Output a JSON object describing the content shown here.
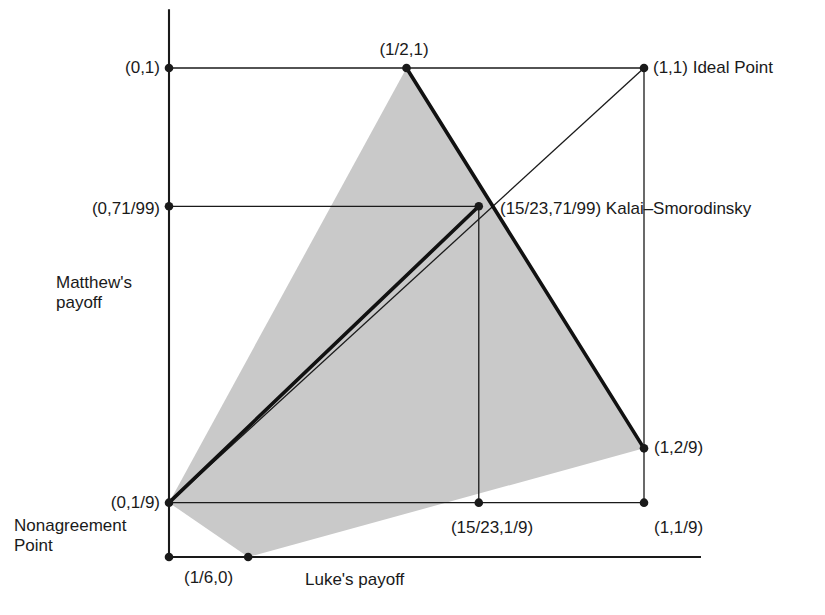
{
  "figure": {
    "axis_labels": {
      "x": "Luke's payoff",
      "y": "Matthew's\npayoff"
    },
    "colors": {
      "region_fill": "#c9c9c9",
      "stroke": "#1a1a1a",
      "thick_stroke": "#111111",
      "background": "#ffffff"
    }
  },
  "annotations": [
    {
      "id": "pt-0-1",
      "text": "(0,1)",
      "x": 0.0,
      "y": 1.0
    },
    {
      "id": "pt-half-1",
      "text": "(1/2,1)",
      "x": 0.5,
      "y": 1.0
    },
    {
      "id": "pt-ideal",
      "text": "(1,1) Ideal Point",
      "x": 1.0,
      "y": 1.0
    },
    {
      "id": "pt-0-71-99",
      "text": "(0,71/99)",
      "x": 0.0,
      "y": 0.717171
    },
    {
      "id": "pt-ks",
      "text": "(15/23,71/99) Kalai–Smorodinsky",
      "x": 0.652174,
      "y": 0.717171
    },
    {
      "id": "pt-1-2-9",
      "text": "(1,2/9)",
      "x": 1.0,
      "y": 0.222222
    },
    {
      "id": "pt-0-1-9",
      "text": "(0,1/9)",
      "x": 0.0,
      "y": 0.111111
    },
    {
      "id": "pt-1523-1-9",
      "text": "(15/23,1/9)",
      "x": 0.652174,
      "y": 0.111111
    },
    {
      "id": "pt-1-1-9",
      "text": "(1,1/9)",
      "x": 1.0,
      "y": 0.111111
    },
    {
      "id": "pt-sixth-0",
      "text": "(1/6,0)",
      "x": 0.166667,
      "y": 0.0
    },
    {
      "id": "nonagreement",
      "text": "Nonagreement\nPoint",
      "x": 0.0,
      "y": 0.111111
    }
  ],
  "chart_data": {
    "type": "scatter",
    "title": "",
    "xlabel": "Luke's payoff",
    "ylabel": "Matthew's payoff",
    "xlim": [
      0,
      1
    ],
    "ylim": [
      0,
      1
    ],
    "grid": false,
    "legend": "none",
    "points": [
      {
        "label": "(0,1)",
        "x": 0.0,
        "y": 1.0,
        "marker": true
      },
      {
        "label": "(1/2,1)",
        "x": 0.5,
        "y": 1.0,
        "marker": true
      },
      {
        "label": "(1,1)",
        "x": 1.0,
        "y": 1.0,
        "marker": true,
        "name": "Ideal Point"
      },
      {
        "label": "(0,71/99)",
        "x": 0.0,
        "y": 0.71717,
        "marker": true
      },
      {
        "label": "(15/23,71/99)",
        "x": 0.65217,
        "y": 0.71717,
        "marker": true,
        "name": "Kalai-Smorodinsky"
      },
      {
        "label": "(1,2/9)",
        "x": 1.0,
        "y": 0.22222,
        "marker": true
      },
      {
        "label": "(0,1/9)",
        "x": 0.0,
        "y": 0.11111,
        "marker": true,
        "name": "Nonagreement Point"
      },
      {
        "label": "(15/23,1/9)",
        "x": 0.65217,
        "y": 0.11111,
        "marker": true
      },
      {
        "label": "(1,1/9)",
        "x": 1.0,
        "y": 0.11111,
        "marker": true
      },
      {
        "label": "(1/6,0)",
        "x": 0.16667,
        "y": 0.0,
        "marker": true
      },
      {
        "label": "(0,0)",
        "x": 0.0,
        "y": 0.0,
        "marker": true
      }
    ],
    "feasible_region": {
      "name": "bargaining set",
      "fill": "#c9c9c9",
      "vertices": [
        {
          "x": 0.0,
          "y": 0.11111
        },
        {
          "x": 0.5,
          "y": 1.0
        },
        {
          "x": 1.0,
          "y": 0.22222
        },
        {
          "x": 0.16667,
          "y": 0.0
        }
      ]
    },
    "lines": [
      {
        "name": "ideal-ray",
        "from": {
          "x": 0.0,
          "y": 0.11111
        },
        "to": {
          "x": 1.0,
          "y": 1.0
        },
        "weight": "thin"
      },
      {
        "name": "nash-ray-thick",
        "from": {
          "x": 0.0,
          "y": 0.11111
        },
        "to": {
          "x": 0.65217,
          "y": 0.71717
        },
        "weight": "thick"
      },
      {
        "name": "pareto-upper",
        "from": {
          "x": 0.5,
          "y": 1.0
        },
        "to": {
          "x": 1.0,
          "y": 0.22222
        },
        "weight": "thick"
      },
      {
        "name": "guide-y-1",
        "from": {
          "x": 0.0,
          "y": 1.0
        },
        "to": {
          "x": 1.0,
          "y": 1.0
        },
        "weight": "thin"
      },
      {
        "name": "guide-y-71-99",
        "from": {
          "x": 0.0,
          "y": 0.71717
        },
        "to": {
          "x": 0.65217,
          "y": 0.71717
        },
        "weight": "thin"
      },
      {
        "name": "guide-y-1-9",
        "from": {
          "x": 0.0,
          "y": 0.11111
        },
        "to": {
          "x": 1.0,
          "y": 0.11111
        },
        "weight": "thin"
      },
      {
        "name": "guide-x-1",
        "from": {
          "x": 1.0,
          "y": 1.0
        },
        "to": {
          "x": 1.0,
          "y": 0.11111
        },
        "weight": "thin"
      },
      {
        "name": "guide-x-15-23",
        "from": {
          "x": 0.65217,
          "y": 0.71717
        },
        "to": {
          "x": 0.65217,
          "y": 0.11111
        },
        "weight": "thin"
      }
    ],
    "axes": {
      "y_axis": {
        "from": {
          "x": 0.0,
          "y": 1.12
        },
        "to": {
          "x": 0.0,
          "y": 0.0
        }
      },
      "x_axis": {
        "from": {
          "x": 0.0,
          "y": 0.0
        },
        "to": {
          "x": 1.12,
          "y": 0.0
        }
      }
    }
  }
}
